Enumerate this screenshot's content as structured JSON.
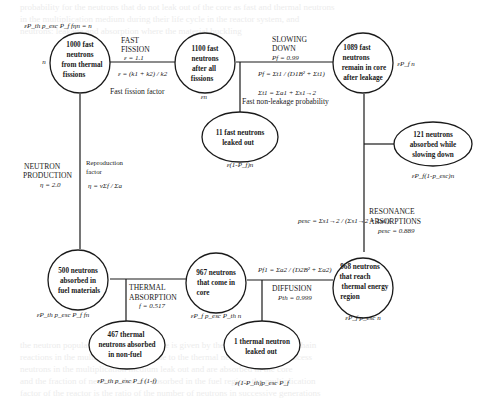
{
  "diagram": {
    "nodes": [
      {
        "id": "n1000",
        "lines": [
          "1000 fast",
          "neutrons",
          "from thermal",
          "fissions"
        ],
        "formula": "εP_th p_esc P_f fηn = n",
        "side_label": "n"
      },
      {
        "id": "n1100",
        "lines": [
          "1100 fast",
          "neutrons",
          "after all",
          "fissions"
        ],
        "formula": "εn"
      },
      {
        "id": "n1089",
        "lines": [
          "1089 fast",
          "neutrons",
          "remain in core",
          "after leakage"
        ],
        "formula": "εP_f n"
      },
      {
        "id": "n11",
        "lines": [
          "11 fast neutrons",
          "leaked out"
        ],
        "formula": "ε(1-P_f)n"
      },
      {
        "id": "n121",
        "lines": [
          "121 neutrons",
          "absorbed while",
          "slowing down"
        ],
        "formula": "εP_f(1-p_esc)n"
      },
      {
        "id": "n968",
        "lines": [
          "968 neutrons",
          "that reach",
          "thermal energy",
          "region"
        ],
        "formula": "εP_f p_esc n"
      },
      {
        "id": "n967",
        "lines": [
          "967 neutrons",
          "that come in",
          "core"
        ],
        "formula": "εP_f p_esc P_th n"
      },
      {
        "id": "n1",
        "lines": [
          "1 thermal neutron",
          "leaked out"
        ],
        "formula": "ε(1-P_th)p_esc P_f"
      },
      {
        "id": "n500",
        "lines": [
          "500 neutrons",
          "absorbed in",
          "fuel materials"
        ],
        "formula": "εP_th p_esc P_f fn"
      },
      {
        "id": "n467",
        "lines": [
          "467 thermal",
          "neutrons absorbed",
          "in non-fuel"
        ],
        "formula": "εP_th p_esc P_f (1-f)"
      }
    ],
    "stages": {
      "fast_fission": {
        "title": [
          "FAST",
          "FISSION"
        ],
        "value": "ε = 1.1",
        "formula": "ε = (k1 + k2) / k2",
        "caption": "Fast fission factor"
      },
      "slowing_down": {
        "title": [
          "SLOWING",
          "DOWN"
        ],
        "value": "Pf = 0.99",
        "formula": "Pf = Σt1 / (D1B² + Σt1)",
        "formula2": "Σt1 = Σa1 + Σs1→2",
        "caption": "Fast non-leakage probability"
      },
      "resonance": {
        "title": [
          "RESONANCE",
          "ABSORPTIONS"
        ],
        "value": "pesc = 0.889",
        "formula": "pesc = Σs1→2 / (Σs1→2 + Σa1)"
      },
      "diffusion": {
        "title": [
          "DIFFUSION"
        ],
        "value": "Pth = 0.999",
        "formula": "Pf1 = Σa2 / (D2B² + Σa2)"
      },
      "thermal_absorption": {
        "title": [
          "THERMAL",
          "ABSORPTION"
        ],
        "value": "f = 0.517"
      },
      "neutron_production": {
        "title": [
          "NEUTRON",
          "PRODUCTION"
        ],
        "value": "η = 2.0",
        "caption": [
          "Reproduction",
          "factor"
        ],
        "formula": "η = νΣf / Σa"
      }
    }
  }
}
